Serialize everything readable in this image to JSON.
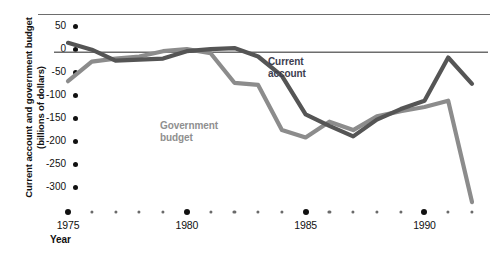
{
  "axis": {
    "y_title_line1": "Current account and government budget",
    "y_title_line2": "(billions of dollars)",
    "x_title": "Year",
    "y_ticks": [
      "50",
      "0",
      "-50",
      "-100",
      "-150",
      "-200",
      "-250",
      "-300"
    ],
    "x_ticks": [
      "1975",
      "1980",
      "1985",
      "1990"
    ]
  },
  "labels": {
    "current_account_line1": "Current",
    "current_account_line2": "account",
    "government_budget_line1": "Government",
    "government_budget_line2": "budget"
  },
  "colors": {
    "current_account": "#555555",
    "government_budget": "#8c8c8c",
    "zero_line": "#6d6d6d",
    "top_rule": "#6d6d6d",
    "tick_dot": "#111111",
    "minor_dot": "#6a6a6a"
  },
  "chart_data": {
    "type": "line",
    "title": "",
    "xlabel": "Year",
    "ylabel": "Current account and government budget (billions of dollars)",
    "xlim": [
      1975,
      1992
    ],
    "ylim": [
      -300,
      50
    ],
    "yticks": [
      50,
      0,
      -50,
      -100,
      -150,
      -200,
      -250,
      -300
    ],
    "xticks": [
      1975,
      1980,
      1985,
      1990
    ],
    "grid": false,
    "legend": "inline-annotations",
    "x": [
      1975,
      1976,
      1977,
      1978,
      1979,
      1980,
      1981,
      1982,
      1983,
      1984,
      1985,
      1986,
      1987,
      1988,
      1989,
      1990,
      1991,
      1992
    ],
    "series": [
      {
        "name": "Current account",
        "color": "#555555",
        "values": [
          18,
          5,
          -16,
          -14,
          -12,
          2,
          6,
          8,
          -8,
          -45,
          -118,
          -140,
          -160,
          -128,
          -108,
          -92,
          -10,
          -60
        ]
      },
      {
        "name": "Government budget",
        "color": "#8c8c8c",
        "values": [
          -55,
          -18,
          -12,
          -8,
          2,
          6,
          -2,
          -58,
          -62,
          -148,
          -162,
          -132,
          -148,
          -122,
          -112,
          -104,
          -92,
          -285
        ]
      }
    ]
  }
}
